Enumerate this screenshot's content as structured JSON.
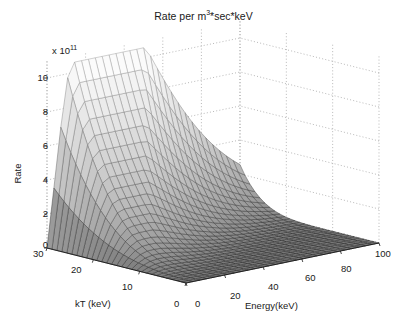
{
  "figure": {
    "title_prefix": "Rate per m",
    "title_sup": "3",
    "title_suffix": "*sec*keV",
    "background": "#ffffff",
    "axis_color": "#1a1a1a",
    "grid_color": "#9a9a9a",
    "mesh_line_color": "#6e6e6e"
  },
  "axes": {
    "z": {
      "label": "Rate",
      "exponent_prefix": "x 10",
      "exponent_value": "11",
      "ticks": [
        "0",
        "2",
        "4",
        "6",
        "8",
        "10"
      ],
      "tick_values": [
        0,
        2,
        4,
        6,
        8,
        10
      ],
      "min": 0,
      "max": 11
    },
    "x": {
      "label": "kT (keV)",
      "ticks": [
        "0",
        "10",
        "20",
        "30"
      ],
      "tick_values": [
        0,
        10,
        20,
        30
      ],
      "min": 0,
      "max": 30
    },
    "y": {
      "label": "Energy(keV)",
      "ticks": [
        "0",
        "20",
        "40",
        "60",
        "80",
        "100"
      ],
      "tick_values": [
        0,
        20,
        40,
        60,
        80,
        100
      ],
      "min": 0,
      "max": 100
    }
  },
  "chart_data": {
    "type": "surface",
    "title": "Rate per m3*sec*keV",
    "xlabel": "kT (keV)",
    "ylabel": "Energy(keV)",
    "zlabel": "Rate",
    "z_scale_exponent": 11,
    "xlim": [
      0,
      30
    ],
    "ylim": [
      0,
      100
    ],
    "zlim": [
      0,
      11
    ],
    "grid": true,
    "legend": null,
    "colormap": "gray",
    "mesh_rows": 28,
    "mesh_cols": 28,
    "peak": {
      "kT": 30,
      "energy": 12,
      "rate": 10.6
    },
    "x": [
      0,
      10,
      20,
      30
    ],
    "y": [
      0,
      20,
      40,
      60,
      80,
      100
    ],
    "z_rows": [
      {
        "kT": 0,
        "values": [
          0.0,
          0.0,
          0.0,
          0.0,
          0.0,
          0.0
        ]
      },
      {
        "kT": 10,
        "values": [
          0.55,
          0.4,
          0.16,
          0.05,
          0.02,
          0.01
        ]
      },
      {
        "kT": 20,
        "values": [
          3.1,
          2.25,
          0.95,
          0.33,
          0.11,
          0.04
        ]
      },
      {
        "kT": 30,
        "values": [
          9.6,
          6.9,
          2.9,
          1.05,
          0.36,
          0.12
        ]
      }
    ]
  }
}
